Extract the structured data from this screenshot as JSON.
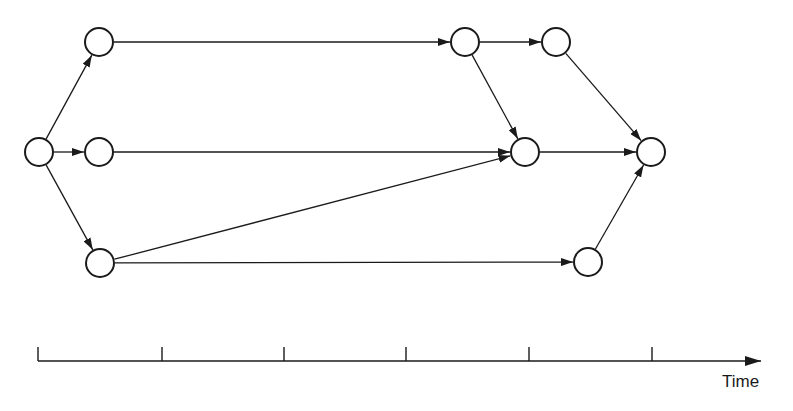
{
  "diagram": {
    "type": "activity-network",
    "node_radius": 14,
    "stroke_color": "#1a1a1a",
    "background": "#ffffff",
    "nodes": [
      {
        "id": "n1",
        "x": 39,
        "y": 152
      },
      {
        "id": "n2",
        "x": 99,
        "y": 42
      },
      {
        "id": "n3",
        "x": 99,
        "y": 152
      },
      {
        "id": "n4",
        "x": 100,
        "y": 263
      },
      {
        "id": "n5",
        "x": 465,
        "y": 42
      },
      {
        "id": "n6",
        "x": 556,
        "y": 42
      },
      {
        "id": "n7",
        "x": 525,
        "y": 152
      },
      {
        "id": "n8",
        "x": 651,
        "y": 152
      },
      {
        "id": "n9",
        "x": 588,
        "y": 262
      }
    ],
    "edges": [
      {
        "from": "n1",
        "to": "n2"
      },
      {
        "from": "n1",
        "to": "n3"
      },
      {
        "from": "n1",
        "to": "n4"
      },
      {
        "from": "n2",
        "to": "n5"
      },
      {
        "from": "n3",
        "to": "n7"
      },
      {
        "from": "n4",
        "to": "n7"
      },
      {
        "from": "n4",
        "to": "n9"
      },
      {
        "from": "n5",
        "to": "n6"
      },
      {
        "from": "n5",
        "to": "n7"
      },
      {
        "from": "n6",
        "to": "n8"
      },
      {
        "from": "n7",
        "to": "n8"
      },
      {
        "from": "n9",
        "to": "n8"
      }
    ]
  },
  "time_axis": {
    "label": "Time",
    "y": 361,
    "x_start": 38,
    "x_end": 761,
    "ticks": [
      38,
      162,
      284,
      406,
      529,
      652
    ],
    "tick_height": 14
  }
}
